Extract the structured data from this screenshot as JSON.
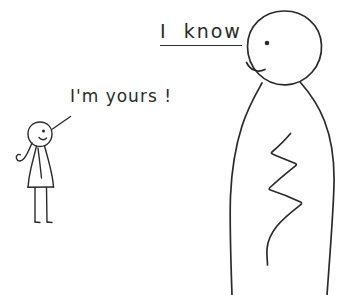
{
  "image": {
    "title": "I know",
    "background_color": "#ffffff",
    "ink_color": "#2b2b2b",
    "width": 358,
    "height": 295
  },
  "captions": {
    "big_figure_line": "I know",
    "big_figure_line_part_1": "I",
    "big_figure_line_part_2": "know",
    "small_figure_line": "I'm yours !"
  },
  "figures": {
    "small": {
      "name": "small stick figure in a dress",
      "features": [
        "round head",
        "dot eye",
        "smile",
        "hair curl",
        "curled arm",
        "triangular dress",
        "two legs",
        "two feet"
      ]
    },
    "large": {
      "name": "large stick figure",
      "features": [
        "large round head",
        "dot eye",
        "smirk",
        "wide body",
        "zigzag line inside body"
      ]
    }
  },
  "annotations": {
    "speech_leader_line": "line connecting small figure head to its caption"
  }
}
